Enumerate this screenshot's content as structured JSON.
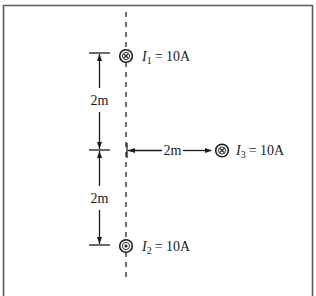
{
  "figure": {
    "type": "magnetic-field-wire-diagram",
    "frame_color": "#5a5a5a",
    "line_color": "#1a1a1a",
    "wires": [
      {
        "id": "I1",
        "symbol": "I",
        "subscript": "1",
        "value_text": "= 10A",
        "direction": "into-page",
        "glyph": "cross"
      },
      {
        "id": "I2",
        "symbol": "I",
        "subscript": "2",
        "value_text": "= 10A",
        "direction": "out-of-page",
        "glyph": "dot"
      },
      {
        "id": "I3",
        "symbol": "I",
        "subscript": "3",
        "value_text": "= 10A",
        "direction": "into-page",
        "glyph": "cross"
      }
    ],
    "dimensions": {
      "upper_vertical": "2m",
      "lower_vertical": "2m",
      "horizontal": "2m"
    }
  }
}
